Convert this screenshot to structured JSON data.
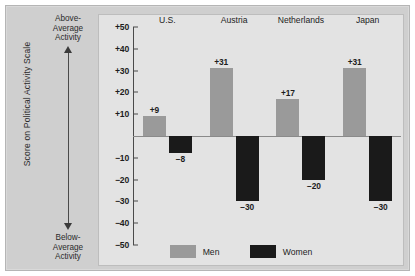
{
  "chart_data": {
    "type": "bar",
    "title": "",
    "xlabel": "",
    "ylabel": "Score on Political Activity Scale",
    "categories": [
      "U.S.",
      "Austria",
      "Netherlands",
      "Japan"
    ],
    "series": [
      {
        "name": "Men",
        "color": "#9a9a9a",
        "values": [
          9,
          31,
          17,
          31
        ],
        "value_labels": [
          "+9",
          "+31",
          "+17",
          "+31"
        ]
      },
      {
        "name": "Women",
        "color": "#1a1a1a",
        "values": [
          -8,
          -30,
          -20,
          -30
        ],
        "value_labels": [
          "−8",
          "−30",
          "−20",
          "−30"
        ]
      }
    ],
    "ylim": [
      -50,
      50
    ],
    "ytick_values": [
      50,
      40,
      30,
      20,
      10,
      -10,
      -20,
      -30,
      -40,
      -50
    ],
    "ytick_labels": [
      "+50",
      "+40",
      "+30",
      "+20",
      "+10",
      "−10",
      "−20",
      "−30",
      "−40",
      "−50"
    ],
    "grid": false,
    "legend_position": "bottom",
    "zero_line": true,
    "annotations": {
      "top": "Above-\nAverage\nActivity",
      "bottom": "Below-\nAverage\nActivity",
      "arrow": "double-headed-vertical-arrow"
    }
  },
  "legend": {
    "men_label": "Men",
    "women_label": "Women"
  },
  "colors": {
    "men": "#9a9a9a",
    "women": "#1a1a1a",
    "panel": "#cfcfcf",
    "plot": "#e3e3e3",
    "axis": "#4a4a4a"
  }
}
